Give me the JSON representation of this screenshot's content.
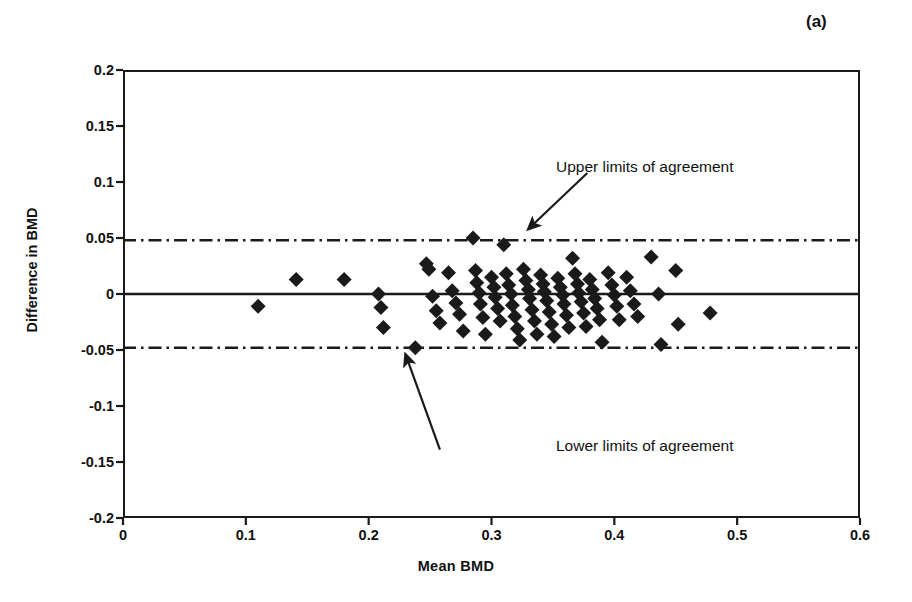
{
  "figure": {
    "panel_label": "(a)",
    "background_color": "#ffffff",
    "ink_color": "#1a1a1a"
  },
  "annotations": {
    "upper": {
      "label": "Upper limits of agreement",
      "arrow_from_x": 0.378,
      "arrow_from_y": 0.108,
      "arrow_to_x": 0.33,
      "arrow_to_y": 0.058
    },
    "lower": {
      "label": "Lower limits of agreement",
      "arrow_from_x": 0.258,
      "arrow_from_y": -0.139,
      "arrow_to_x": 0.23,
      "arrow_to_y": -0.054
    }
  },
  "chart_data": {
    "type": "scatter",
    "title": "",
    "subtitle": "",
    "xlabel": "Mean  BMD",
    "ylabel": "Difference in BMD",
    "xlim": [
      0,
      0.6
    ],
    "ylim": [
      -0.2,
      0.2
    ],
    "xticks": [
      0,
      0.1,
      0.2,
      0.3,
      0.4,
      0.5,
      0.6
    ],
    "xtick_labels": [
      "0",
      "0.1",
      "0.2",
      "0.3",
      "0.4",
      "0.5",
      "0.6"
    ],
    "yticks": [
      0.2,
      0.15,
      0.1,
      0.05,
      0,
      -0.05,
      -0.1,
      -0.15,
      -0.2
    ],
    "ytick_labels": [
      "0.2",
      "0.15",
      "0.1",
      "0.05",
      "0",
      "-0.05",
      "-0.1",
      "-0.15",
      "-0.2"
    ],
    "grid": false,
    "legend": null,
    "marker": "diamond",
    "marker_color": "#1a1a1a",
    "marker_size": 15,
    "reference_lines": [
      {
        "name": "mean-difference",
        "label": "Mean difference",
        "y": 0.0,
        "style": "solid",
        "color": "#1a1a1a"
      },
      {
        "name": "upper-limit-of-agreement",
        "label": "Upper limits of agreement",
        "y": 0.048,
        "style": "dash-dot",
        "color": "#1a1a1a"
      },
      {
        "name": "lower-limit-of-agreement",
        "label": "Lower limits of agreement",
        "y": -0.048,
        "style": "dash-dot",
        "color": "#1a1a1a"
      }
    ],
    "series": [
      {
        "name": "BMD pairs",
        "points": [
          [
            0.11,
            -0.011
          ],
          [
            0.141,
            0.013
          ],
          [
            0.18,
            0.013
          ],
          [
            0.208,
            0.0
          ],
          [
            0.21,
            -0.012
          ],
          [
            0.212,
            -0.03
          ],
          [
            0.238,
            -0.048
          ],
          [
            0.247,
            0.027
          ],
          [
            0.249,
            0.022
          ],
          [
            0.252,
            -0.002
          ],
          [
            0.255,
            -0.015
          ],
          [
            0.258,
            -0.026
          ],
          [
            0.265,
            0.019
          ],
          [
            0.268,
            0.003
          ],
          [
            0.271,
            -0.008
          ],
          [
            0.274,
            -0.018
          ],
          [
            0.277,
            -0.033
          ],
          [
            0.285,
            0.05
          ],
          [
            0.287,
            0.021
          ],
          [
            0.288,
            0.01
          ],
          [
            0.29,
            0.001
          ],
          [
            0.291,
            -0.009
          ],
          [
            0.293,
            -0.021
          ],
          [
            0.295,
            -0.036
          ],
          [
            0.3,
            0.015
          ],
          [
            0.302,
            0.006
          ],
          [
            0.303,
            -0.003
          ],
          [
            0.305,
            -0.013
          ],
          [
            0.307,
            -0.024
          ],
          [
            0.31,
            0.044
          ],
          [
            0.312,
            0.018
          ],
          [
            0.314,
            0.008
          ],
          [
            0.316,
            0.0
          ],
          [
            0.317,
            -0.01
          ],
          [
            0.319,
            -0.02
          ],
          [
            0.321,
            -0.031
          ],
          [
            0.323,
            -0.041
          ],
          [
            0.326,
            0.022
          ],
          [
            0.328,
            0.012
          ],
          [
            0.33,
            0.004
          ],
          [
            0.331,
            -0.004
          ],
          [
            0.333,
            -0.014
          ],
          [
            0.335,
            -0.024
          ],
          [
            0.337,
            -0.036
          ],
          [
            0.34,
            0.017
          ],
          [
            0.342,
            0.009
          ],
          [
            0.343,
            0.002
          ],
          [
            0.345,
            -0.006
          ],
          [
            0.347,
            -0.016
          ],
          [
            0.349,
            -0.027
          ],
          [
            0.351,
            -0.038
          ],
          [
            0.354,
            0.014
          ],
          [
            0.356,
            0.006
          ],
          [
            0.358,
            -0.001
          ],
          [
            0.359,
            -0.009
          ],
          [
            0.361,
            -0.019
          ],
          [
            0.363,
            -0.03
          ],
          [
            0.366,
            0.032
          ],
          [
            0.368,
            0.018
          ],
          [
            0.37,
            0.009
          ],
          [
            0.371,
            0.001
          ],
          [
            0.373,
            -0.007
          ],
          [
            0.375,
            -0.017
          ],
          [
            0.377,
            -0.029
          ],
          [
            0.38,
            0.013
          ],
          [
            0.382,
            0.004
          ],
          [
            0.384,
            -0.004
          ],
          [
            0.386,
            -0.013
          ],
          [
            0.388,
            -0.023
          ],
          [
            0.39,
            -0.043
          ],
          [
            0.395,
            0.019
          ],
          [
            0.398,
            0.008
          ],
          [
            0.4,
            -0.001
          ],
          [
            0.402,
            -0.011
          ],
          [
            0.404,
            -0.023
          ],
          [
            0.41,
            0.015
          ],
          [
            0.413,
            0.003
          ],
          [
            0.416,
            -0.009
          ],
          [
            0.419,
            -0.02
          ],
          [
            0.43,
            0.033
          ],
          [
            0.436,
            0.0
          ],
          [
            0.438,
            -0.045
          ],
          [
            0.45,
            0.021
          ],
          [
            0.452,
            -0.027
          ],
          [
            0.478,
            -0.017
          ]
        ]
      }
    ]
  }
}
